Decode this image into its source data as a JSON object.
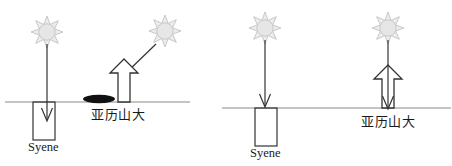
{
  "figure": {
    "colors": {
      "ink": "#1a1a1a",
      "stroke": "#222222",
      "horizon": "#808080",
      "sun_ray": "#bfbfbf",
      "sun_disc": "#e0e0e0",
      "shadow": "#000000",
      "background": "#ffffff"
    },
    "panels": [
      {
        "id": "left-panel",
        "name": "curved-earth-case",
        "horizon": {
          "x1": 5,
          "x2": 190,
          "y": 102
        },
        "suns": [
          {
            "id": "sun-syene-left",
            "cx": 47,
            "cy": 32,
            "r": 9,
            "rays": 8,
            "icon": "sun-icon"
          },
          {
            "id": "sun-alexandria-left",
            "cx": 165,
            "cy": 31,
            "r": 9,
            "rays": 8,
            "icon": "sun-icon"
          }
        ],
        "rays": [
          {
            "id": "ray-vertical-syene-left",
            "type": "vertical-arrow",
            "x": 47,
            "y1": 44,
            "y2": 118
          },
          {
            "id": "ray-slanted-alexandria-left",
            "type": "slanted-arrow",
            "x1": 157,
            "y1": 45,
            "x2": 125,
            "y2": 74
          }
        ],
        "well": {
          "id": "well-syene-left",
          "x": 33,
          "y": 102,
          "w": 22,
          "h": 38,
          "label": "Syene"
        },
        "obelisk": {
          "id": "obelisk-alexandria-left",
          "x": 110,
          "base_y": 102,
          "w": 28,
          "h": 43,
          "label": "亚历山大",
          "filled": false
        },
        "shadow": {
          "id": "shadow-ellipse-left",
          "cx": 99,
          "cy": 99,
          "rx": 16,
          "ry": 4
        },
        "labels": [
          {
            "id": "label-syene-left",
            "text": "Syene",
            "x": 28,
            "y": 143,
            "script": "latin"
          },
          {
            "id": "label-alexandria-left",
            "text": "亚历山大",
            "x": 92,
            "y": 110,
            "script": "cjk"
          }
        ]
      },
      {
        "id": "right-panel",
        "name": "flat-earth-case",
        "horizon": {
          "x1": 222,
          "x2": 450,
          "y": 108
        },
        "suns": [
          {
            "id": "sun-syene-right",
            "cx": 265,
            "cy": 28,
            "r": 9,
            "rays": 8,
            "icon": "sun-icon"
          },
          {
            "id": "sun-alexandria-right",
            "cx": 388,
            "cy": 28,
            "r": 9,
            "rays": 8,
            "icon": "sun-icon"
          }
        ],
        "rays": [
          {
            "id": "ray-vertical-syene-right",
            "type": "vertical-arrow",
            "x": 265,
            "y1": 40,
            "y2": 106
          },
          {
            "id": "ray-vertical-alexandria-right",
            "type": "vertical-arrow",
            "x": 388,
            "y1": 40,
            "y2": 110
          }
        ],
        "well": {
          "id": "well-syene-right",
          "x": 255,
          "y": 108,
          "w": 22,
          "h": 38,
          "label": "Syene"
        },
        "obelisk": {
          "id": "obelisk-alexandria-right",
          "x": 374,
          "base_y": 110,
          "w": 28,
          "h": 45,
          "label": "亚历山大",
          "filled": false
        },
        "shadow": null,
        "labels": [
          {
            "id": "label-syene-right",
            "text": "Syene",
            "x": 248,
            "y": 149,
            "script": "latin"
          },
          {
            "id": "label-alexandria-right",
            "text": "亚历山大",
            "x": 362,
            "y": 117,
            "script": "cjk"
          }
        ]
      }
    ]
  }
}
